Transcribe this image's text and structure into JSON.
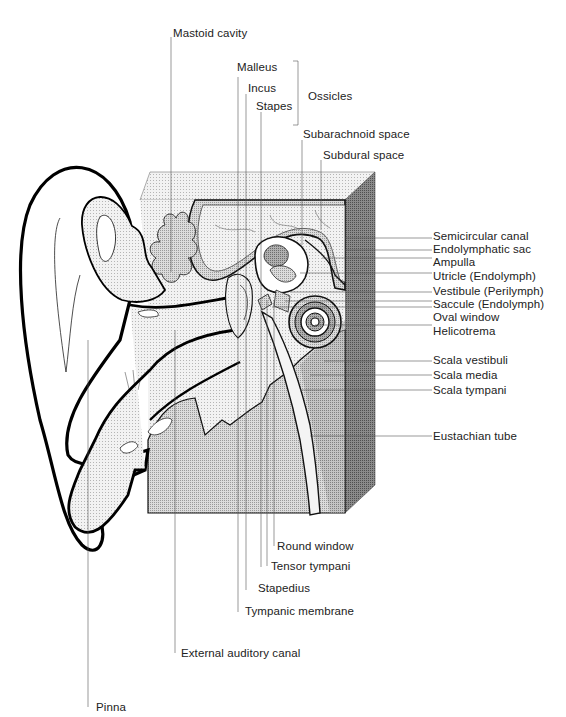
{
  "figure": {
    "page_header_fragment": "",
    "colors": {
      "ink": "#111111",
      "leader": "#555555",
      "light_stipple": "#e6e6e6",
      "mid_stipple": "#c8c8c8",
      "dark_stipple": "#9a9a9a",
      "side_face": "#8c8c8c",
      "background": "#ffffff"
    }
  },
  "labels": {
    "top": {
      "mastoid_cavity": "Mastoid cavity",
      "malleus": "Malleus",
      "incus": "Incus",
      "stapes": "Stapes",
      "ossicles": "Ossicles",
      "subarachnoid_space": "Subarachnoid space",
      "subdural_space": "Subdural space"
    },
    "right": [
      {
        "id": "semicircular-canal",
        "text": "Semicircular canal"
      },
      {
        "id": "endolymphatic-sac",
        "text": "Endolymphatic sac"
      },
      {
        "id": "ampulla",
        "text": "Ampulla"
      },
      {
        "id": "utricle",
        "text": "Utricle (Endolymph)"
      },
      {
        "id": "vestibule",
        "text": "Vestibule (Perilymph)"
      },
      {
        "id": "saccule",
        "text": "Saccule (Endolymph)"
      },
      {
        "id": "oval-window",
        "text": "Oval window"
      },
      {
        "id": "helicotrema",
        "text": "Helicotrema"
      },
      {
        "id": "scala-vestibuli",
        "text": "Scala vestibuli"
      },
      {
        "id": "scala-media",
        "text": "Scala media"
      },
      {
        "id": "scala-tympani",
        "text": "Scala tympani"
      },
      {
        "id": "eustachian-tube",
        "text": "Eustachian tube"
      }
    ],
    "bottom": {
      "round_window": "Round window",
      "tensor_tympani": "Tensor tympani",
      "stapedius": "Stapedius",
      "tympanic_membrane": "Tympanic membrane",
      "external_auditory_canal": "External auditory canal",
      "pinna": "Pinna"
    }
  }
}
